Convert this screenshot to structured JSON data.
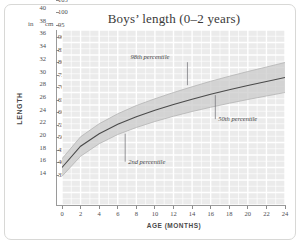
{
  "figure": {
    "title": "Boys’ length (0–2 years)",
    "y_axis_title": "LENGTH",
    "x_axis_title": "AGE (MONTHS)",
    "unit_header_left": "in",
    "unit_header_right": "cm",
    "frame_color": "#d8d8d6",
    "plot_background": "#ebebeb",
    "grid_color": "#ffffff",
    "band_color": "#c9c9c9",
    "curve_color": "#4a4a4a"
  },
  "chart_data": {
    "type": "line",
    "title": "Boys’ length (0–2 years)",
    "subtitle": "",
    "xlabel": "AGE (MONTHS)",
    "ylabel": "LENGTH",
    "xlim": [
      0,
      24
    ],
    "ylim_cm": [
      35,
      105
    ],
    "ylim_in": [
      14,
      40
    ],
    "grid": true,
    "legend_position": "inline-annotations",
    "x_ticks": [
      0,
      2,
      4,
      6,
      8,
      10,
      12,
      14,
      16,
      18,
      20,
      22,
      24
    ],
    "y_ticks_cm": [
      35,
      40,
      45,
      50,
      55,
      60,
      65,
      70,
      75,
      80,
      85,
      90,
      95,
      100,
      105
    ],
    "y_ticks_in": [
      14,
      16,
      18,
      20,
      22,
      24,
      26,
      28,
      30,
      32,
      34,
      36,
      38,
      40
    ],
    "x": [
      0,
      2,
      4,
      6,
      8,
      10,
      12,
      14,
      16,
      18,
      20,
      22,
      24
    ],
    "series": [
      {
        "name": "2nd percentile",
        "unit": "cm",
        "values": [
          46.5,
          54.5,
          59.5,
          63.2,
          66.0,
          68.4,
          70.5,
          72.4,
          74.1,
          75.7,
          77.2,
          78.6,
          80.0
        ]
      },
      {
        "name": "50th percentile",
        "unit": "cm",
        "values": [
          50.0,
          58.5,
          63.5,
          67.3,
          70.3,
          72.9,
          75.2,
          77.3,
          79.3,
          81.1,
          82.8,
          84.4,
          86.0
        ]
      },
      {
        "name": "98th percentile",
        "unit": "cm",
        "values": [
          53.5,
          62.3,
          67.5,
          71.5,
          74.8,
          77.5,
          80.0,
          82.3,
          84.5,
          86.5,
          88.4,
          90.2,
          92.0
        ]
      }
    ],
    "annotations": [
      {
        "label": "98th percentile",
        "x": 13.5,
        "points_to_series": "98th percentile"
      },
      {
        "label": "50th percentile",
        "x": 16.5,
        "points_to_series": "50th percentile"
      },
      {
        "label": "2nd percentile",
        "x": 6.8,
        "points_to_series": "2nd percentile"
      }
    ]
  }
}
